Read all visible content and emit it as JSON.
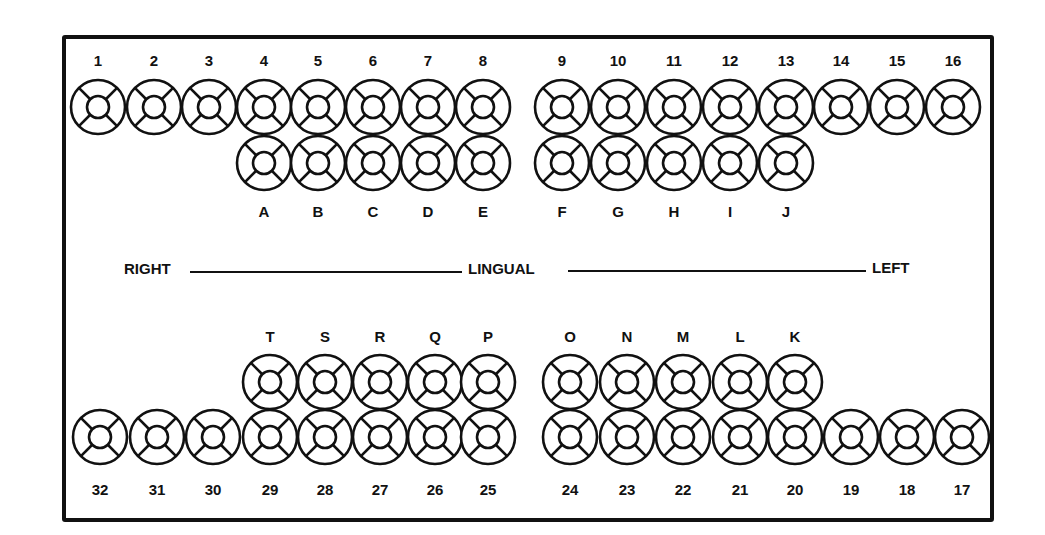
{
  "diagram": {
    "type": "dental-chart",
    "tooth_style": "circle with inner circle and four diagonal spokes (5 surfaces)",
    "colors": {
      "ink": "#111111",
      "background": "#ffffff"
    }
  },
  "midline": {
    "left_label": "RIGHT",
    "center_label": "LINGUAL",
    "right_label": "LEFT"
  },
  "upper_permanent": {
    "labels": [
      "1",
      "2",
      "3",
      "4",
      "5",
      "6",
      "7",
      "8",
      "9",
      "10",
      "11",
      "12",
      "13",
      "14",
      "15",
      "16"
    ],
    "x": [
      98,
      154,
      209,
      264,
      318,
      373,
      428,
      483,
      562,
      618,
      674,
      730,
      786,
      841,
      897,
      953
    ],
    "y": 107,
    "label_y": 66
  },
  "upper_primary": {
    "labels": [
      "A",
      "B",
      "C",
      "D",
      "E",
      "F",
      "G",
      "H",
      "I",
      "J"
    ],
    "x": [
      264,
      318,
      373,
      428,
      483,
      562,
      618,
      674,
      730,
      786
    ],
    "y": 163,
    "label_y": 217
  },
  "lower_primary": {
    "labels": [
      "T",
      "S",
      "R",
      "Q",
      "P",
      "O",
      "N",
      "M",
      "L",
      "K"
    ],
    "x": [
      270,
      325,
      380,
      435,
      488,
      570,
      627,
      683,
      740,
      795
    ],
    "y": 382,
    "label_y": 342
  },
  "lower_permanent": {
    "labels": [
      "32",
      "31",
      "30",
      "29",
      "28",
      "27",
      "26",
      "25",
      "24",
      "23",
      "22",
      "21",
      "20",
      "19",
      "18",
      "17"
    ],
    "x": [
      100,
      157,
      213,
      270,
      325,
      380,
      435,
      488,
      570,
      627,
      683,
      740,
      795,
      851,
      907,
      962
    ],
    "y": 437,
    "label_y": 495
  }
}
